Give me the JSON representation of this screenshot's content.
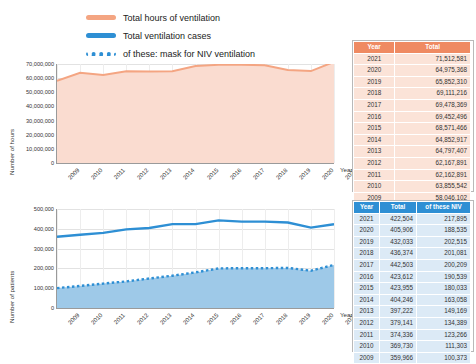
{
  "legend": {
    "items": [
      {
        "name": "total-hours-of-ventilation",
        "label": "Total hours of ventilation",
        "style": "orange",
        "color": "#f4a582"
      },
      {
        "name": "total-ventilation-cases",
        "label": "Total ventilation cases",
        "style": "blue",
        "color": "#2e8fd4"
      },
      {
        "name": "mask-for-niv-ventilation",
        "label": "of these: mask for NIV ventilation",
        "style": "dotted",
        "color": "#2e8fd4"
      }
    ]
  },
  "chart_data": [
    {
      "type": "area",
      "name": "hours-chart",
      "title": "",
      "xlabel": "Year",
      "ylabel": "Number of hours",
      "categories": [
        "2009",
        "2010",
        "2011",
        "2012",
        "2013",
        "2014",
        "2015",
        "2016",
        "2017",
        "2018",
        "2019",
        "2020",
        "2021"
      ],
      "series": [
        {
          "name": "Total hours of ventilation",
          "color": "#f4a582",
          "values": [
            58046102,
            63855542,
            62162891,
            64882957,
            64797407,
            64852917,
            68571466,
            69452496,
            69478369,
            69111216,
            65852310,
            64975368,
            71512581
          ]
        }
      ],
      "ylim": [
        0,
        70000000
      ],
      "yticks": [
        0,
        10000000,
        20000000,
        30000000,
        40000000,
        50000000,
        60000000,
        70000000
      ],
      "ytick_labels": [
        "0",
        "10,000,000",
        "20,000,000",
        "30,000,000",
        "40,000,000",
        "50,000,000",
        "60,000,000",
        "70,000,000"
      ],
      "grid": true
    },
    {
      "type": "line",
      "name": "cases-chart",
      "title": "",
      "xlabel": "Year",
      "ylabel": "Number of patients",
      "categories": [
        "2009",
        "2010",
        "2011",
        "2012",
        "2013",
        "2014",
        "2015",
        "2016",
        "2017",
        "2018",
        "2019",
        "2020",
        "2021"
      ],
      "series": [
        {
          "name": "Total ventilation cases",
          "color": "#2e8fd4",
          "style": "solid",
          "values": [
            359966,
            369730,
            379141,
            397222,
            404246,
            423955,
            423612,
            442503,
            436374,
            436374,
            432033,
            405906,
            422504
          ]
        },
        {
          "name": "of these: mask for NIV ventilation",
          "color": "#2e8fd4",
          "style": "dotted",
          "values": [
            100373,
            111303,
            123266,
            134389,
            149169,
            163058,
            180033,
            200209,
            201081,
            201081,
            202515,
            188535,
            217895
          ]
        }
      ],
      "ylim": [
        0,
        500000
      ],
      "yticks": [
        0,
        100000,
        200000,
        300000,
        400000,
        500000
      ],
      "ytick_labels": [
        "0",
        "100,000",
        "200,000",
        "300,000",
        "400,000",
        "500,000"
      ],
      "grid": true
    }
  ],
  "table_hours": {
    "name": "hours-table",
    "headers": [
      "Year",
      "Total"
    ],
    "rows": [
      [
        "2021",
        "71,512,581"
      ],
      [
        "2020",
        "64,975,368"
      ],
      [
        "2019",
        "65,852,310"
      ],
      [
        "2018",
        "69,111,216"
      ],
      [
        "2017",
        "69,478,369"
      ],
      [
        "2016",
        "69,452,496"
      ],
      [
        "2015",
        "68,571,466"
      ],
      [
        "2014",
        "64,852,917"
      ],
      [
        "2013",
        "64,797,407"
      ],
      [
        "2012",
        "62,167,891"
      ],
      [
        "2011",
        "62,162,891"
      ],
      [
        "2010",
        "63,855,542"
      ],
      [
        "2009",
        "58,046,102"
      ]
    ]
  },
  "table_cases": {
    "name": "cases-table",
    "headers": [
      "Year",
      "Total",
      "of these NIV"
    ],
    "rows": [
      [
        "2021",
        "422,504",
        "217,895"
      ],
      [
        "2020",
        "405,906",
        "188,535"
      ],
      [
        "2019",
        "432,033",
        "202,515"
      ],
      [
        "2018",
        "436,374",
        "201,081"
      ],
      [
        "2017",
        "442,503",
        "200,209"
      ],
      [
        "2016",
        "423,612",
        "190,539"
      ],
      [
        "2015",
        "423,955",
        "180,033"
      ],
      [
        "2014",
        "404,246",
        "163,058"
      ],
      [
        "2013",
        "397,222",
        "149,169"
      ],
      [
        "2012",
        "379,141",
        "134,389"
      ],
      [
        "2011",
        "374,336",
        "123,266"
      ],
      [
        "2010",
        "369,730",
        "111,303"
      ],
      [
        "2009",
        "359,966",
        "100,373"
      ]
    ]
  }
}
